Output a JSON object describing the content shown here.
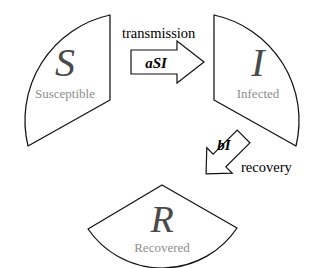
{
  "diagram": {
    "type": "state-transition-diagram",
    "background_color": "#ffffff",
    "stroke_color": "#111111",
    "letter_color": "#4a4a4a",
    "name_color": "#8d8d8d",
    "label_color": "#000000"
  },
  "compartments": [
    {
      "id": "susceptible",
      "letter": "S",
      "name": "Susceptible",
      "shape": "circular-sector",
      "position": "left"
    },
    {
      "id": "infected",
      "letter": "I",
      "name": "Infected",
      "shape": "circular-sector",
      "position": "right"
    },
    {
      "id": "recovered",
      "letter": "R",
      "name": "Recovered",
      "shape": "circular-sector",
      "position": "bottom"
    }
  ],
  "flows": [
    {
      "id": "transmission",
      "label": "transmission",
      "rate": "aSI",
      "from": "susceptible",
      "to": "infected",
      "direction": "right"
    },
    {
      "id": "recovery",
      "label": "recovery",
      "rate": "bI",
      "from": "infected",
      "to": "recovered",
      "direction": "down-left"
    }
  ]
}
